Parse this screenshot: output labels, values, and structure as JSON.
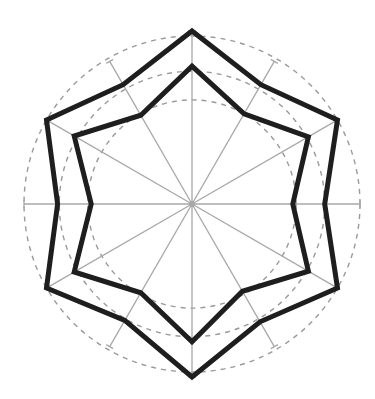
{
  "chart_data": {
    "type": "radar",
    "title": "",
    "center": [
      192,
      204
    ],
    "unit_radius_px": 168,
    "axes_count": 12,
    "axis_angles_deg": [
      90,
      60,
      30,
      0,
      330,
      300,
      270,
      240,
      210,
      180,
      150,
      120
    ],
    "axis_labels": [],
    "grid": {
      "rings": [
        0.62,
        0.79,
        1.0
      ],
      "ring_style": "dashed",
      "spoke_length": [
        1.03,
        0.98,
        0.98,
        1.0,
        0.98,
        0.98,
        1.03,
        0.98,
        0.98,
        1.0,
        0.98,
        0.98
      ]
    },
    "series": [
      {
        "name": "outer",
        "color": "#1e1e1e",
        "values": [
          1.03,
          0.82,
          1.0,
          0.79,
          1.0,
          0.81,
          1.03,
          0.8,
          1.0,
          0.8,
          1.0,
          0.82
        ]
      },
      {
        "name": "inner",
        "color": "#1e1e1e",
        "values": [
          0.82,
          0.62,
          0.8,
          0.6,
          0.8,
          0.6,
          0.82,
          0.61,
          0.81,
          0.6,
          0.81,
          0.61
        ]
      }
    ],
    "legend": null
  },
  "colors": {
    "grid": "#a8a8a8",
    "series": "#1e1e1e",
    "background": "#ffffff"
  }
}
